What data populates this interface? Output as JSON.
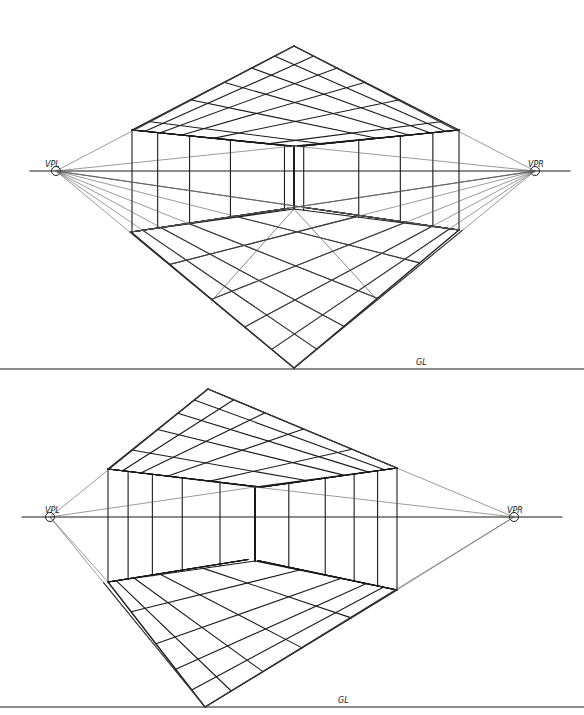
{
  "colors": {
    "ink": "#1a1a1a",
    "light_ink": "#555555",
    "paper": "#ffffff"
  },
  "figures": [
    {
      "id": "top",
      "labels": {
        "vp_left": "VPL",
        "vp_right": "VPR",
        "ground_line": "GL"
      },
      "horizon_y": 171,
      "horizon_x": [
        30,
        570
      ],
      "vp_left": [
        56,
        171
      ],
      "vp_right": [
        535,
        171
      ],
      "ground_line_y": 369,
      "ground_line_x": [
        0,
        584
      ],
      "gl_label_pos": [
        416,
        365
      ],
      "ceiling_apex": [
        294,
        46
      ],
      "ceiling_left": [
        132,
        130
      ],
      "ceiling_right": [
        459,
        130
      ],
      "ceiling_inner": [
        294,
        146
      ],
      "floor_left": [
        131,
        232
      ],
      "floor_right": [
        459,
        230
      ],
      "floor_inner": [
        294,
        209
      ],
      "floor_apex": [
        294,
        368
      ],
      "ceiling_divisions": 9,
      "floor_divisions": 8,
      "wall_columns": 7,
      "diagonal_rays": true
    },
    {
      "id": "bottom",
      "labels": {
        "vp_left": "VPL",
        "vp_right": "VPR",
        "ground_line": "GL"
      },
      "horizon_y": 517,
      "horizon_x": [
        22,
        562
      ],
      "vp_left": [
        50,
        517
      ],
      "vp_right": [
        514,
        517
      ],
      "ground_line_y": 707,
      "ground_line_x": [
        0,
        584
      ],
      "gl_label_pos": [
        338,
        703
      ],
      "ceiling_apex": [
        208,
        389
      ],
      "ceiling_left": [
        108,
        469
      ],
      "ceiling_right": [
        397,
        468
      ],
      "ceiling_inner": [
        255,
        487
      ],
      "floor_left": [
        108,
        582
      ],
      "floor_right": [
        397,
        590
      ],
      "floor_inner": [
        255,
        561
      ],
      "floor_apex": [
        205,
        707
      ],
      "ceiling_divisions": 8,
      "floor_divisions": 8,
      "wall_columns": 8,
      "diagonal_rays": false
    }
  ]
}
